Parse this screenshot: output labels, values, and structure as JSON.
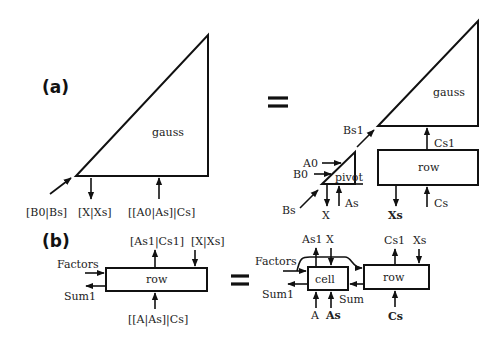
{
  "diagram": {
    "part_a": {
      "tag": "(a)",
      "lhs": {
        "block": "gauss",
        "ports": {
          "in_left": "[B0|Bs]",
          "out_bottom": "[X|Xs]",
          "in_bottom": "[[A0|As]|Cs]"
        }
      },
      "equals": "=",
      "rhs": {
        "blocks": {
          "gauss": "gauss",
          "row": "row",
          "pivot": "pivot"
        },
        "labels": {
          "bs1": "Bs1",
          "cs1": "Cs1",
          "a0": "A0",
          "b0": "B0",
          "bs": "Bs",
          "x": "X",
          "as": "As",
          "xs": "Xs",
          "cs": "Cs"
        }
      }
    },
    "part_b": {
      "tag": "(b)",
      "lhs": {
        "block": "row",
        "ports": {
          "top_out": "[As1|Cs1]",
          "top_in": "[X|Xs]",
          "left_in": "Factors",
          "left_out": "Sum1",
          "bottom_in": "[[A|As]|Cs]"
        }
      },
      "equals": "=",
      "rhs": {
        "blocks": {
          "cell": "cell",
          "row": "row"
        },
        "labels": {
          "as1": "As1",
          "x": "X",
          "cs1": "Cs1",
          "xs": "Xs",
          "factors": "Factors",
          "sum1": "Sum1",
          "sum": "Sum",
          "a": "A",
          "as": "As",
          "cs": "Cs"
        }
      }
    }
  }
}
